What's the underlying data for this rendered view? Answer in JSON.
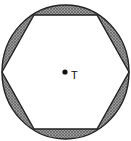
{
  "diagram": {
    "circle": {
      "cx": 65.5,
      "cy": 72,
      "rx": 63.5,
      "ry": 67
    },
    "hexagon_vertices": [
      [
        2,
        72
      ],
      [
        34,
        15
      ],
      [
        97,
        15
      ],
      [
        129,
        72
      ],
      [
        97,
        129
      ],
      [
        34,
        129
      ]
    ],
    "center_point": {
      "x": 65,
      "y": 72,
      "label": "T"
    },
    "colors": {
      "shade": "#8a8a8a",
      "hatch": "#5a5a5a",
      "stroke": "#222222",
      "background": "#ffffff"
    }
  }
}
